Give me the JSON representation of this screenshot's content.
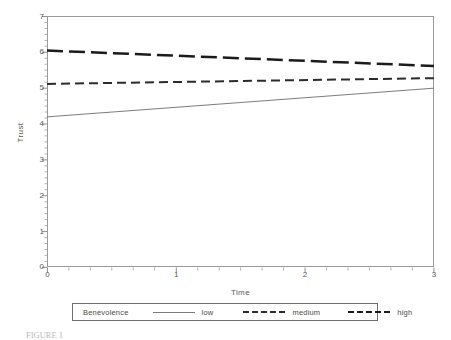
{
  "chart_data": {
    "type": "line",
    "title": "",
    "xlabel": "Time",
    "ylabel": "Trust",
    "xlim": [
      0,
      3
    ],
    "ylim": [
      0,
      7
    ],
    "xticks": [
      0,
      1,
      2,
      3
    ],
    "yticks": [
      0,
      1,
      2,
      3,
      4,
      5,
      6,
      7
    ],
    "xtick_labels": [
      "0",
      "1",
      "2",
      "3"
    ],
    "ytick_labels": [
      "0",
      "1",
      "2",
      "3",
      "4",
      "5",
      "6",
      "7"
    ],
    "grid": false,
    "minor_ticks": true,
    "legend_position": "below-axes",
    "legend_title": "Benevolence",
    "x": [
      0,
      3
    ],
    "series": [
      {
        "name": "low",
        "label": "low",
        "style": "solid",
        "color": "#7c7c7c",
        "width": 1,
        "values": [
          4.2,
          5.0
        ]
      },
      {
        "name": "medium",
        "label": "medium",
        "style": "dashed-short",
        "color": "#2b2b2b",
        "width": 2,
        "values": [
          5.12,
          5.28
        ]
      },
      {
        "name": "high",
        "label": "high",
        "style": "dashed-long",
        "color": "#1b1b1b",
        "width": 2.5,
        "values": [
          6.05,
          5.62
        ]
      }
    ]
  },
  "axes": {
    "ylabel": "Trust",
    "xlabel": "Time",
    "ytick_labels": [
      "7",
      "6",
      "5",
      "4",
      "3",
      "2",
      "1",
      "0"
    ],
    "xtick_labels": [
      "0",
      "1",
      "2",
      "3"
    ]
  },
  "legend": {
    "title": "Benevolence",
    "entries": [
      {
        "label": "low"
      },
      {
        "label": "medium"
      },
      {
        "label": "high"
      }
    ]
  },
  "caption": {
    "text": "FIGURE 1"
  },
  "colors": {
    "frame": "#9a9a9a",
    "text": "#58585a",
    "low": "#7c7c7c",
    "medium": "#2b2b2b",
    "high": "#1b1b1b",
    "background": "#ffffff"
  }
}
